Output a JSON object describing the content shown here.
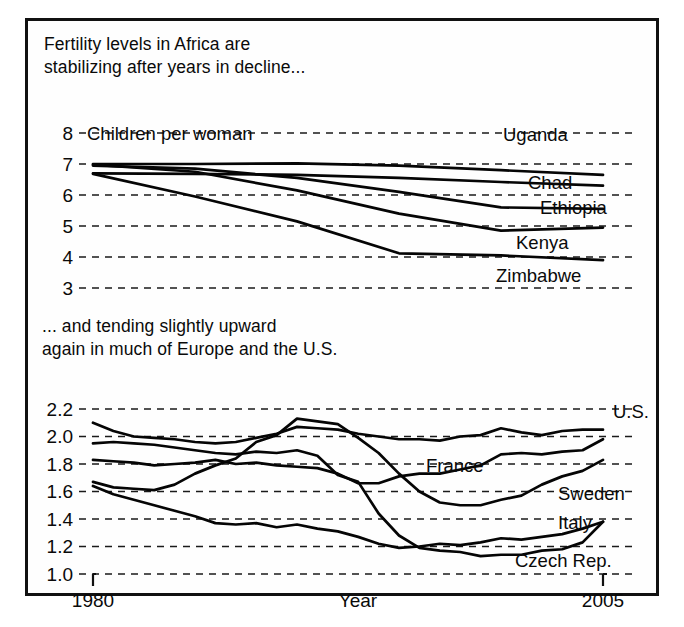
{
  "figure": {
    "caption_top": "Fertility levels in Africa are\nstabilizing after years in decline...",
    "caption_bottom": "... and tending slightly upward\nagain in much of Europe and the U.S.",
    "unit_label": "Children per woman",
    "xlabel": "Year",
    "xtick_left": "1980",
    "xtick_right": "2005",
    "line_color": "#050505",
    "grid_color": "#1a1a1a",
    "background": "#fefefe",
    "border_color": "#111111"
  },
  "chart_data": [
    {
      "type": "line",
      "title": "Fertility levels in Africa are stabilizing after years in decline...",
      "xlabel": "Year",
      "ylabel": "Children per woman",
      "xlim": [
        1980,
        2005
      ],
      "ylim": [
        2.6,
        8.3
      ],
      "yticks": [
        8,
        7,
        6,
        5,
        4,
        3
      ],
      "ytick_labels": [
        "8",
        "7",
        "6",
        "5",
        "4",
        "3"
      ],
      "grid": true,
      "legend": "inline-right",
      "x": [
        1980,
        1985,
        1990,
        1995,
        2000,
        2005
      ],
      "series": [
        {
          "name": "Uganda",
          "label": "Uganda",
          "values": [
            7.0,
            7.0,
            7.02,
            6.95,
            6.8,
            6.65
          ]
        },
        {
          "name": "Chad",
          "label": "Chad",
          "values": [
            6.7,
            6.68,
            6.65,
            6.55,
            6.42,
            6.3
          ]
        },
        {
          "name": "Ethiopia",
          "label": "Ethiopia",
          "values": [
            6.95,
            6.85,
            6.55,
            6.1,
            5.6,
            5.55
          ]
        },
        {
          "name": "Kenya",
          "label": "Kenya",
          "values": [
            6.98,
            6.75,
            6.15,
            5.4,
            4.85,
            4.95
          ]
        },
        {
          "name": "Zimbabwe",
          "label": "Zimbabwe",
          "values": [
            6.68,
            5.95,
            5.15,
            4.12,
            4.05,
            3.9
          ]
        }
      ]
    },
    {
      "type": "line",
      "title": "... and tending slightly upward again in much of Europe and the U.S.",
      "xlabel": "Year",
      "ylabel": "Children per woman",
      "xlim": [
        1980,
        2005
      ],
      "ylim": [
        0.95,
        2.28
      ],
      "yticks": [
        2.2,
        2.0,
        1.8,
        1.6,
        1.4,
        1.2,
        1.0
      ],
      "ytick_labels": [
        "2.2",
        "2.0",
        "1.8",
        "1.6",
        "1.4",
        "1.2",
        "1.0"
      ],
      "grid": true,
      "legend": "inline-right",
      "x": [
        1980,
        1981,
        1982,
        1983,
        1984,
        1985,
        1986,
        1987,
        1988,
        1989,
        1990,
        1991,
        1992,
        1993,
        1994,
        1995,
        1996,
        1997,
        1998,
        1999,
        2000,
        2001,
        2002,
        2003,
        2004,
        2005
      ],
      "series": [
        {
          "name": "U.S.",
          "label": "U.S.",
          "values": [
            2.1,
            2.04,
            2.0,
            1.99,
            1.98,
            1.96,
            1.95,
            1.96,
            1.99,
            2.02,
            2.07,
            2.06,
            2.05,
            2.02,
            2.0,
            1.98,
            1.98,
            1.97,
            2.0,
            2.01,
            2.06,
            2.03,
            2.01,
            2.04,
            2.05,
            2.05
          ]
        },
        {
          "name": "Czech Rep.",
          "label": "Czech Rep.",
          "values": [
            1.95,
            1.96,
            1.95,
            1.94,
            1.92,
            1.9,
            1.88,
            1.87,
            1.89,
            1.88,
            1.9,
            1.86,
            1.72,
            1.67,
            1.44,
            1.28,
            1.19,
            1.17,
            1.16,
            1.13,
            1.14,
            1.14,
            1.17,
            1.18,
            1.23,
            1.38
          ]
        },
        {
          "name": "France",
          "label": "France",
          "values": [
            1.83,
            1.82,
            1.81,
            1.79,
            1.8,
            1.81,
            1.83,
            1.8,
            1.81,
            1.79,
            1.78,
            1.77,
            1.73,
            1.66,
            1.66,
            1.71,
            1.73,
            1.73,
            1.76,
            1.79,
            1.87,
            1.88,
            1.87,
            1.89,
            1.9,
            1.98
          ]
        },
        {
          "name": "Sweden",
          "label": "Sweden",
          "values": [
            1.67,
            1.63,
            1.62,
            1.61,
            1.65,
            1.73,
            1.79,
            1.84,
            1.96,
            2.01,
            2.13,
            2.11,
            2.09,
            1.99,
            1.88,
            1.73,
            1.6,
            1.52,
            1.5,
            1.5,
            1.54,
            1.57,
            1.65,
            1.71,
            1.75,
            1.83
          ]
        },
        {
          "name": "Italy",
          "label": "Italy",
          "values": [
            1.64,
            1.58,
            1.54,
            1.5,
            1.46,
            1.42,
            1.37,
            1.36,
            1.37,
            1.34,
            1.36,
            1.33,
            1.31,
            1.27,
            1.22,
            1.19,
            1.2,
            1.22,
            1.21,
            1.23,
            1.26,
            1.25,
            1.27,
            1.29,
            1.33,
            1.38
          ]
        }
      ]
    }
  ]
}
